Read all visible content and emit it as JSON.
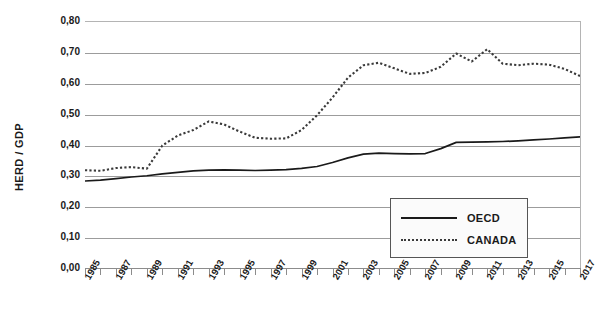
{
  "chart_data": {
    "type": "line",
    "title": "",
    "xlabel": "",
    "ylabel": "HERD / GDP",
    "ylim": [
      0.0,
      0.8
    ],
    "xlim": [
      1985,
      2017
    ],
    "grid": true,
    "legend_position": "inside-bottom-right",
    "y_ticks": [
      "0,00",
      "0,10",
      "0,20",
      "0,30",
      "0,40",
      "0,50",
      "0,60",
      "0,70",
      "0,80"
    ],
    "y_tick_values": [
      0.0,
      0.1,
      0.2,
      0.3,
      0.4,
      0.5,
      0.6,
      0.7,
      0.8
    ],
    "x_tick_labels": [
      "1985",
      "1987",
      "1989",
      "1991",
      "1993",
      "1995",
      "1997",
      "1999",
      "2001",
      "2003",
      "2005",
      "2007",
      "2009",
      "2011",
      "2013",
      "2015",
      "2017"
    ],
    "x": [
      1985,
      1986,
      1987,
      1988,
      1989,
      1990,
      1991,
      1992,
      1993,
      1994,
      1995,
      1996,
      1997,
      1998,
      1999,
      2000,
      2001,
      2002,
      2003,
      2004,
      2005,
      2006,
      2007,
      2008,
      2009,
      2010,
      2011,
      2012,
      2013,
      2014,
      2015,
      2016,
      2017
    ],
    "series": [
      {
        "name": "OECD",
        "style": "solid",
        "color": "#1a1a1a",
        "values": [
          0.285,
          0.288,
          0.293,
          0.298,
          0.302,
          0.308,
          0.313,
          0.318,
          0.32,
          0.321,
          0.32,
          0.319,
          0.32,
          0.322,
          0.326,
          0.332,
          0.345,
          0.36,
          0.372,
          0.375,
          0.374,
          0.373,
          0.374,
          0.39,
          0.41,
          0.411,
          0.412,
          0.413,
          0.415,
          0.418,
          0.421,
          0.425,
          0.428
        ]
      },
      {
        "name": "CANADA",
        "style": "dotted",
        "color": "#3a3a3a",
        "values": [
          0.32,
          0.318,
          0.327,
          0.33,
          0.325,
          0.4,
          0.432,
          0.45,
          0.478,
          0.468,
          0.445,
          0.425,
          0.422,
          0.423,
          0.45,
          0.498,
          0.555,
          0.62,
          0.66,
          0.668,
          0.65,
          0.632,
          0.635,
          0.655,
          0.698,
          0.672,
          0.712,
          0.665,
          0.66,
          0.665,
          0.662,
          0.648,
          0.625
        ]
      }
    ]
  },
  "legend": {
    "items": [
      {
        "label": "OECD"
      },
      {
        "label": "CANADA"
      }
    ]
  }
}
